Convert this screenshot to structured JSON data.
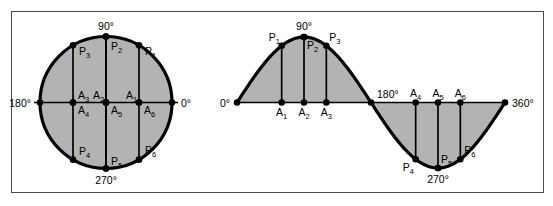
{
  "figure": {
    "fill_color": "#b3b3b3",
    "stroke_color": "#000000",
    "frame_color": "#4a4a4a",
    "background": "#ffffff"
  },
  "circle": {
    "name": "unit-circle",
    "center": [
      106,
      102.5
    ],
    "radius": 66,
    "angle_labels": [
      {
        "id": "circle-0",
        "text": "0°",
        "angle": 0
      },
      {
        "id": "circle-90",
        "text": "90°",
        "angle": 90
      },
      {
        "id": "circle-180",
        "text": "180°",
        "angle": 180
      },
      {
        "id": "circle-270",
        "text": "270°",
        "angle": 270
      }
    ],
    "points": [
      {
        "id": "P1",
        "label": "P",
        "sub": "1",
        "angle": 60
      },
      {
        "id": "P2",
        "label": "P",
        "sub": "2",
        "angle": 90
      },
      {
        "id": "P3",
        "label": "P",
        "sub": "3",
        "angle": 120
      },
      {
        "id": "P4",
        "label": "P",
        "sub": "4",
        "angle": 240
      },
      {
        "id": "P5",
        "label": "P",
        "sub": "5",
        "angle": 270
      },
      {
        "id": "P6",
        "label": "P",
        "sub": "6",
        "angle": 300
      }
    ],
    "feet": [
      {
        "id": "A1",
        "label": "A",
        "sub": "1",
        "angle": 60
      },
      {
        "id": "A2",
        "label": "A",
        "sub": "2",
        "angle": 90
      },
      {
        "id": "A3",
        "label": "A",
        "sub": "3",
        "angle": 120
      },
      {
        "id": "A4",
        "label": "A",
        "sub": "4",
        "angle": 240
      },
      {
        "id": "A5",
        "label": "A",
        "sub": "5",
        "angle": 270
      },
      {
        "id": "A6",
        "label": "A",
        "sub": "6",
        "angle": 300
      }
    ]
  },
  "wave": {
    "name": "sine-wave",
    "x_start": 237,
    "x_end": 505,
    "baseline_y": 102.5,
    "amplitude": 65.5,
    "axis_labels": [
      {
        "id": "wave-0",
        "text": "0°",
        "angle": 0
      },
      {
        "id": "wave-90",
        "text": "90°",
        "angle": 90
      },
      {
        "id": "wave-180",
        "text": "180°",
        "angle": 180
      },
      {
        "id": "wave-270",
        "text": "270°",
        "angle": 270
      },
      {
        "id": "wave-360",
        "text": "360°",
        "angle": 360
      }
    ],
    "points": [
      {
        "id": "P1",
        "label": "P",
        "sub": "1",
        "angle": 60
      },
      {
        "id": "P2",
        "label": "P",
        "sub": "2",
        "angle": 90
      },
      {
        "id": "P3",
        "label": "P",
        "sub": "3",
        "angle": 120
      },
      {
        "id": "P4",
        "label": "P",
        "sub": "4",
        "angle": 240
      },
      {
        "id": "P5",
        "label": "P",
        "sub": "5",
        "angle": 270
      },
      {
        "id": "P6",
        "label": "P",
        "sub": "6",
        "angle": 300
      }
    ],
    "feet": [
      {
        "id": "A1",
        "label": "A",
        "sub": "1",
        "angle": 60
      },
      {
        "id": "A2",
        "label": "A",
        "sub": "2",
        "angle": 90
      },
      {
        "id": "A3",
        "label": "A",
        "sub": "3",
        "angle": 120
      },
      {
        "id": "A4",
        "label": "A",
        "sub": "4",
        "angle": 240
      },
      {
        "id": "A5",
        "label": "A",
        "sub": "5",
        "angle": 270
      },
      {
        "id": "A6",
        "label": "A",
        "sub": "6",
        "angle": 300
      }
    ]
  },
  "chart_data": {
    "type": "line",
    "xlabel": "",
    "ylabel": "",
    "xlim": [
      0,
      360
    ],
    "ylim": [
      -1,
      1
    ],
    "grid": false,
    "legend": null,
    "x": [
      0,
      60,
      90,
      120,
      180,
      240,
      270,
      300,
      360
    ],
    "values": [
      0,
      0.866,
      1,
      0.866,
      0,
      -0.866,
      -1,
      -0.866,
      0
    ],
    "annotations": [
      "0°",
      "90°",
      "180°",
      "270°",
      "360°"
    ]
  }
}
